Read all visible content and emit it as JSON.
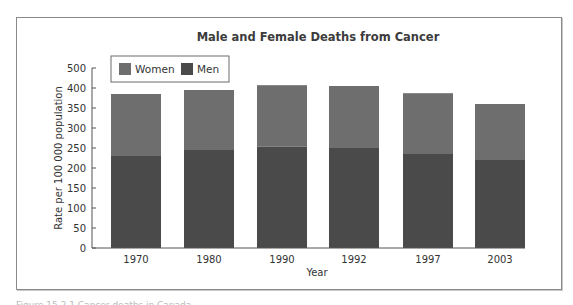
{
  "chart_data": {
    "type": "bar",
    "stacked": true,
    "title": "Male and Female Deaths from Cancer",
    "xlabel": "Year",
    "ylabel": "Rate per 100 000 population",
    "categories": [
      "1970",
      "1980",
      "1990",
      "1992",
      "1997",
      "2003"
    ],
    "series": [
      {
        "name": "Men",
        "color": "#4a4a4a",
        "values": [
          230,
          245,
          253,
          252,
          237,
          222
        ]
      },
      {
        "name": "Women",
        "color": "#6e6e6e",
        "values": [
          155,
          150,
          154,
          153,
          150,
          138
        ]
      }
    ],
    "totals": [
      385,
      395,
      407,
      405,
      387,
      360
    ],
    "y_ticks": [
      {
        "label": "0",
        "pos": 0
      },
      {
        "label": "50",
        "pos": 50
      },
      {
        "label": "100",
        "pos": 100
      },
      {
        "label": "150",
        "pos": 150
      },
      {
        "label": "200",
        "pos": 200
      },
      {
        "label": "250",
        "pos": 250
      },
      {
        "label": "300",
        "pos": 300
      },
      {
        "label": "350",
        "pos": 350
      },
      {
        "label": "400",
        "pos": 400
      },
      {
        "label": "500",
        "pos": 450
      }
    ],
    "ylim": [
      0,
      500
    ],
    "grid": false,
    "legend": {
      "position": "top-left",
      "entries": [
        {
          "label": "Women",
          "color": "#6e6e6e"
        },
        {
          "label": "Men",
          "color": "#4a4a4a"
        }
      ]
    }
  },
  "caption": "Figure 15.2.1 Cancer deaths in Canada"
}
